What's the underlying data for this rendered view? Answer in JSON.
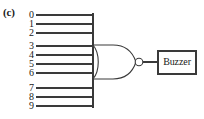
{
  "figure": {
    "part_label": "(c)",
    "type": "logic-circuit-diagram",
    "background_color": "#ffffff",
    "line_color": "#3a3a3a"
  },
  "inputs": {
    "count": 10,
    "labels": [
      "0",
      "1",
      "2",
      "3",
      "4",
      "5",
      "6",
      "7",
      "8",
      "9"
    ],
    "y_positions": [
      15,
      24,
      33,
      46,
      55,
      64,
      73,
      88,
      97,
      106
    ],
    "line_start_x": 36,
    "line_end_x": 93
  },
  "gate": {
    "name": "nor-gate",
    "kind": "NOR",
    "has_output_bubble": true,
    "body_left_x": 93,
    "body_right_x": 134,
    "body_top_y": 45,
    "body_bottom_y": 79,
    "bubble_center_x": 138,
    "bubble_center_y": 62,
    "bubble_radius": 4
  },
  "output": {
    "wire_start_x": 142,
    "wire_end_x": 158,
    "wire_y": 62
  },
  "buzzer": {
    "label": "Buzzer",
    "box_left_x": 158,
    "box_top_y": 51,
    "box_width": 38,
    "box_height": 23
  }
}
